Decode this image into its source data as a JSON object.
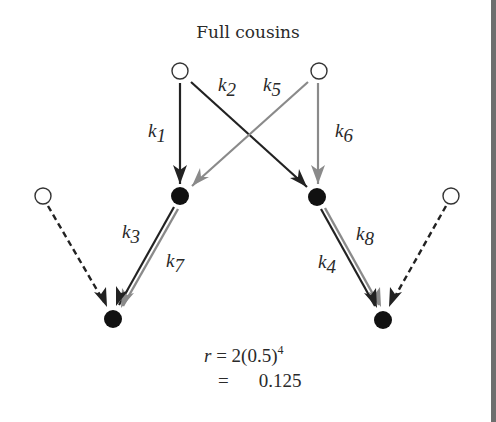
{
  "title": "Full cousins",
  "colors": {
    "dark": "#222222",
    "gray": "#8a8a8a",
    "border": "#6e6e6e"
  },
  "nodes": [
    {
      "id": "gp1",
      "type": "open",
      "x": 180,
      "y": 71
    },
    {
      "id": "gp2",
      "type": "open",
      "x": 319,
      "y": 71
    },
    {
      "id": "p1",
      "type": "filled",
      "x": 180,
      "y": 196
    },
    {
      "id": "p2",
      "type": "filled",
      "x": 317,
      "y": 197
    },
    {
      "id": "o1",
      "type": "open",
      "x": 43,
      "y": 196
    },
    {
      "id": "o2",
      "type": "open",
      "x": 451,
      "y": 196
    },
    {
      "id": "c1",
      "type": "filled",
      "x": 113,
      "y": 319
    },
    {
      "id": "c2",
      "type": "filled",
      "x": 383,
      "y": 320
    }
  ],
  "edges": [
    {
      "from": "gp1",
      "to": "p1",
      "label": "k",
      "sub": "1",
      "color": "dark"
    },
    {
      "from": "gp1",
      "to": "p2",
      "label": "k",
      "sub": "2",
      "color": "dark"
    },
    {
      "from": "p1",
      "to": "c1",
      "label": "k",
      "sub": "3",
      "color": "dark"
    },
    {
      "from": "p2",
      "to": "c2",
      "label": "k",
      "sub": "4",
      "color": "dark"
    },
    {
      "from": "gp2",
      "to": "p1",
      "label": "k",
      "sub": "5",
      "color": "gray"
    },
    {
      "from": "gp2",
      "to": "p2",
      "label": "k",
      "sub": "6",
      "color": "gray"
    },
    {
      "from": "p1",
      "to": "c1",
      "label": "k",
      "sub": "7",
      "color": "gray"
    },
    {
      "from": "p2",
      "to": "c2",
      "label": "k",
      "sub": "8",
      "color": "gray"
    },
    {
      "from": "o1",
      "to": "c1",
      "label": "",
      "sub": "",
      "color": "dark",
      "dashed": true
    },
    {
      "from": "o2",
      "to": "c2",
      "label": "",
      "sub": "",
      "color": "dark",
      "dashed": true
    }
  ],
  "labels": {
    "k1": {
      "main": "k",
      "sub": "1"
    },
    "k2": {
      "main": "k",
      "sub": "2"
    },
    "k3": {
      "main": "k",
      "sub": "3"
    },
    "k4": {
      "main": "k",
      "sub": "4"
    },
    "k5": {
      "main": "k",
      "sub": "5"
    },
    "k6": {
      "main": "k",
      "sub": "6"
    },
    "k7": {
      "main": "k",
      "sub": "7"
    },
    "k8": {
      "main": "k",
      "sub": "8"
    }
  },
  "formula": {
    "line1_var": "r",
    "line1_rest": " = 2(0.5)",
    "line1_exp": "4",
    "line2_eq": "=",
    "line2_value": "0.125"
  }
}
